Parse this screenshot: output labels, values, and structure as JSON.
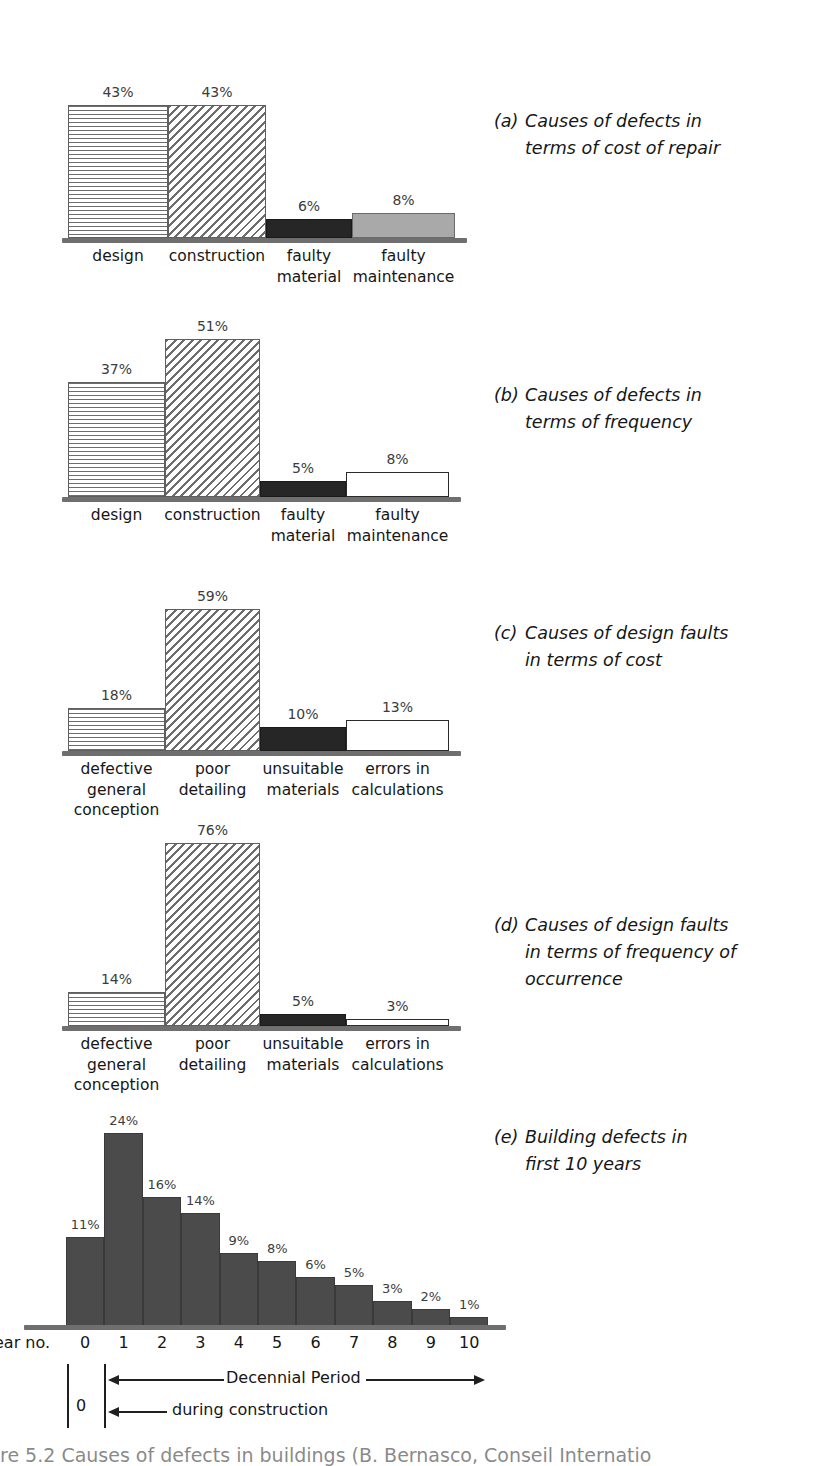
{
  "figure": {
    "bottom_caption": "re 5.2 Causes of defects in buildings (B. Bernasco, Conseil Internatio"
  },
  "chart_data": [
    {
      "id": "a",
      "type": "bar",
      "title": "Causes of defects in terms of cost of repair",
      "tag": "(a)",
      "caption_lines": [
        "Causes of defects in",
        "terms of cost of repair"
      ],
      "categories": [
        "design",
        "construction",
        "faulty material",
        "faulty maintenance"
      ],
      "category_lines": [
        [
          "design"
        ],
        [
          "construction"
        ],
        [
          "faulty",
          "material"
        ],
        [
          "faulty",
          "maintenance"
        ]
      ],
      "values": [
        43,
        43,
        6,
        8
      ],
      "labels": [
        "43%",
        "43%",
        "6%",
        "8%"
      ],
      "fills": [
        "hatch-horizontal",
        "hatch-diagonal",
        "solid-dark",
        "solid-gray"
      ],
      "ylim": [
        0,
        59
      ],
      "unit": "%",
      "xlabel": "",
      "ylabel": ""
    },
    {
      "id": "b",
      "type": "bar",
      "title": "Causes of defects in terms of frequency",
      "tag": "(b)",
      "caption_lines": [
        "Causes of defects in",
        "terms of frequency"
      ],
      "categories": [
        "design",
        "construction",
        "faulty material",
        "faulty maintenance"
      ],
      "category_lines": [
        [
          "design"
        ],
        [
          "construction"
        ],
        [
          "faulty",
          "material"
        ],
        [
          "faulty",
          "maintenance"
        ]
      ],
      "values": [
        37,
        51,
        5,
        8
      ],
      "labels": [
        "37%",
        "51%",
        "5%",
        "8%"
      ],
      "fills": [
        "hatch-horizontal",
        "hatch-diagonal",
        "solid-dark",
        "solid-white"
      ],
      "ylim": [
        0,
        59
      ],
      "unit": "%",
      "xlabel": "",
      "ylabel": ""
    },
    {
      "id": "c",
      "type": "bar",
      "title": "Causes of design faults in terms of cost",
      "tag": "(c)",
      "caption_lines": [
        "Causes of design faults",
        "in terms of cost"
      ],
      "categories": [
        "defective general conception",
        "poor detailing",
        "unsuitable materials",
        "errors in calculations"
      ],
      "category_lines": [
        [
          "defective",
          "general",
          "conception"
        ],
        [
          "poor",
          "detailing"
        ],
        [
          "unsuitable",
          "materials"
        ],
        [
          "errors in",
          "calculations"
        ]
      ],
      "values": [
        18,
        59,
        10,
        13
      ],
      "labels": [
        "18%",
        "59%",
        "10%",
        "13%"
      ],
      "fills": [
        "hatch-horizontal",
        "hatch-diagonal",
        "solid-dark",
        "solid-white"
      ],
      "ylim": [
        0,
        76
      ],
      "unit": "%",
      "xlabel": "",
      "ylabel": ""
    },
    {
      "id": "d",
      "type": "bar",
      "title": "Causes of design faults in terms of frequency of occurrence",
      "tag": "(d)",
      "caption_lines": [
        "Causes of design faults",
        "in terms of frequency of",
        "occurrence"
      ],
      "categories": [
        "defective general conception",
        "poor detailing",
        "unsuitable materials",
        "errors in calculations"
      ],
      "category_lines": [
        [
          "defective",
          "general",
          "conception"
        ],
        [
          "poor",
          "detailing"
        ],
        [
          "unsuitable",
          "materials"
        ],
        [
          "errors in",
          "calculations"
        ]
      ],
      "values": [
        14,
        76,
        5,
        3
      ],
      "labels": [
        "14%",
        "76%",
        "5%",
        "3%"
      ],
      "fills": [
        "hatch-horizontal",
        "hatch-diagonal",
        "solid-dark",
        "solid-white"
      ],
      "ylim": [
        0,
        76
      ],
      "unit": "%",
      "xlabel": "",
      "ylabel": ""
    },
    {
      "id": "e",
      "type": "bar",
      "title": "Building defects in first 10 years",
      "tag": "(e)",
      "caption_lines": [
        "Building defects in",
        "first 10 years"
      ],
      "categories": [
        "0",
        "1",
        "2",
        "3",
        "4",
        "5",
        "6",
        "7",
        "8",
        "9",
        "10"
      ],
      "values": [
        11,
        24,
        16,
        14,
        9,
        8,
        6,
        5,
        3,
        2,
        1
      ],
      "labels": [
        "11%",
        "24%",
        "16%",
        "14%",
        "9%",
        "8%",
        "6%",
        "5%",
        "3%",
        "2%",
        "1%"
      ],
      "fills": [
        "solid-hist"
      ],
      "ylim": [
        0,
        24
      ],
      "unit": "%",
      "xlabel": "ear no.",
      "ylabel": "",
      "annotations": [
        {
          "text": "Decennial Period",
          "kind": "double-arrow"
        },
        {
          "text": "during construction",
          "kind": "left-arrow"
        },
        {
          "text": "0",
          "kind": "tick-label"
        }
      ]
    }
  ]
}
